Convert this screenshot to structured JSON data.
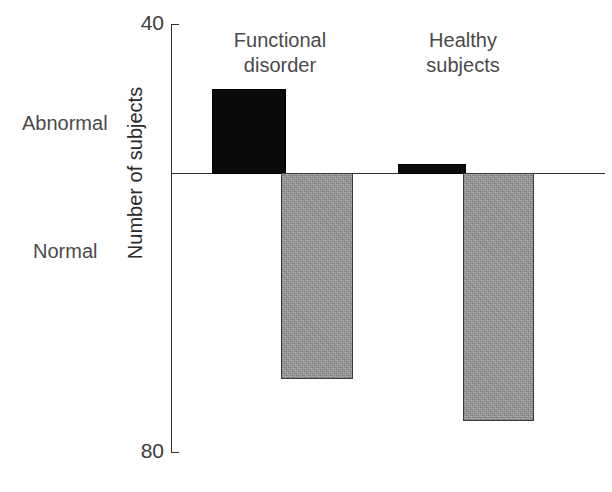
{
  "chart_data": {
    "type": "bar",
    "title": "",
    "subtitle": "",
    "xlabel": "",
    "ylabel": "Number of subjects",
    "ylim": [
      40,
      80
    ],
    "y_tick_labels": [
      "40",
      "80"
    ],
    "grid": false,
    "legend_position": "none",
    "orientation": "vertical-diverging",
    "baseline_value": 56,
    "categories": [
      "Functional disorder",
      "Healthy subjects"
    ],
    "row_labels": [
      "Abnormal",
      "Normal"
    ],
    "series": [
      {
        "name": "Abnormal",
        "direction": "up",
        "color": "#0b0b0b",
        "values": [
          8,
          1
        ]
      },
      {
        "name": "Normal",
        "direction": "down",
        "color": "#9b9b9b",
        "values": [
          19,
          23
        ]
      }
    ],
    "annotations": []
  },
  "chart": {
    "axis": {
      "tick_top": "40",
      "tick_bottom": "80",
      "y_title": "Number of subjects"
    },
    "side_labels": {
      "abnormal": "Abnormal",
      "normal": "Normal"
    },
    "groups": [
      {
        "line1": "Functional",
        "line2": "disorder"
      },
      {
        "line1": "Healthy",
        "line2": "subjects"
      }
    ],
    "bars": [
      {
        "name": "functional-disorder-abnormal",
        "x": 212,
        "y": 89,
        "w": 74,
        "h": 85,
        "kind": "abnormal"
      },
      {
        "name": "functional-disorder-normal",
        "x": 281,
        "y": 173,
        "w": 72,
        "h": 206,
        "kind": "normal"
      },
      {
        "name": "healthy-subjects-abnormal",
        "x": 398,
        "y": 164,
        "w": 68,
        "h": 10,
        "kind": "abnormal"
      },
      {
        "name": "healthy-subjects-normal",
        "x": 463,
        "y": 173,
        "w": 71,
        "h": 248,
        "kind": "normal"
      }
    ],
    "colors": {
      "abnormal_fill": "#0b0b0b",
      "normal_fill": "#9b9b9b",
      "axis": "#2f2f2f",
      "text": "#4a4a4a",
      "background": "#ffffff"
    }
  }
}
